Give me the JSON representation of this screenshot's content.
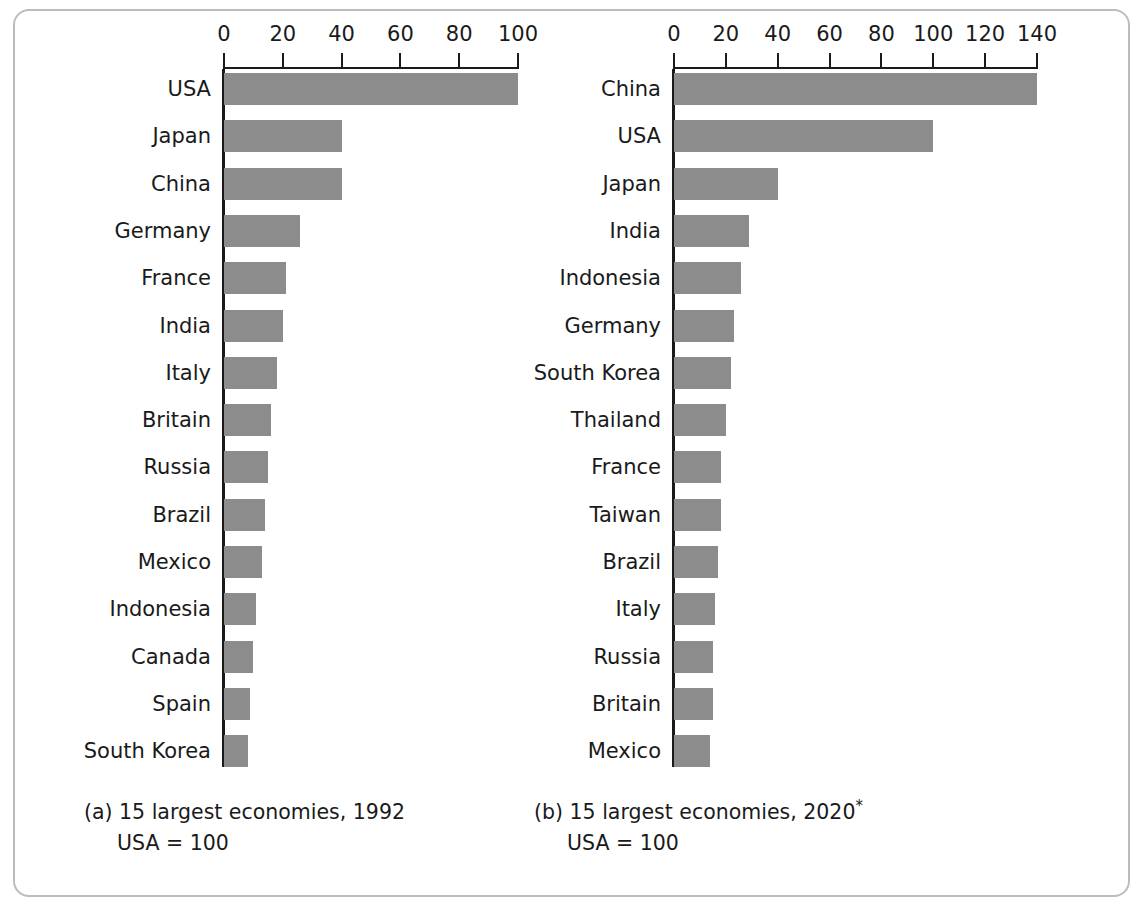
{
  "figure": {
    "bar_color": "#8c8c8c",
    "axis_color": "#1a1a1a",
    "frame_color": "#bcbcbc",
    "background": "#ffffff"
  },
  "chart_data": [
    {
      "type": "bar",
      "orientation": "horizontal",
      "title": "(a) 15 largest economies, 1992",
      "subtitle": "USA = 100",
      "caption_label": "(a)",
      "caption_text": "15 largest economies, 1992",
      "caption_note": "USA = 100",
      "xlabel": "",
      "ylabel": "",
      "xlim": [
        0,
        100
      ],
      "xticks": [
        0,
        20,
        40,
        60,
        80,
        100
      ],
      "xtick_labels": [
        "0",
        "20",
        "40",
        "60",
        "80",
        "100"
      ],
      "grid": false,
      "legend": "none",
      "categories": [
        "USA",
        "Japan",
        "China",
        "Germany",
        "France",
        "India",
        "Italy",
        "Britain",
        "Russia",
        "Brazil",
        "Mexico",
        "Indonesia",
        "Canada",
        "Spain",
        "South Korea"
      ],
      "values": [
        100,
        40,
        40,
        26,
        21,
        20,
        18,
        16,
        15,
        14,
        13,
        11,
        10,
        9,
        8
      ]
    },
    {
      "type": "bar",
      "orientation": "horizontal",
      "title": "(b) 15 largest economies, 2020*",
      "subtitle": "USA = 100",
      "caption_label": "(b)",
      "caption_text": "15 largest economies, 2020",
      "caption_star": "*",
      "caption_note": "USA = 100",
      "xlabel": "",
      "ylabel": "",
      "xlim": [
        0,
        140
      ],
      "xticks": [
        0,
        20,
        40,
        60,
        80,
        100,
        120,
        140
      ],
      "xtick_labels": [
        "0",
        "20",
        "40",
        "60",
        "80",
        "100",
        "120",
        "140"
      ],
      "grid": false,
      "legend": "none",
      "categories": [
        "China",
        "USA",
        "Japan",
        "India",
        "Indonesia",
        "Germany",
        "South Korea",
        "Thailand",
        "France",
        "Taiwan",
        "Brazil",
        "Italy",
        "Russia",
        "Britain",
        "Mexico"
      ],
      "values": [
        140,
        100,
        40,
        29,
        26,
        23,
        22,
        20,
        18,
        18,
        17,
        16,
        15,
        15,
        14
      ]
    }
  ]
}
